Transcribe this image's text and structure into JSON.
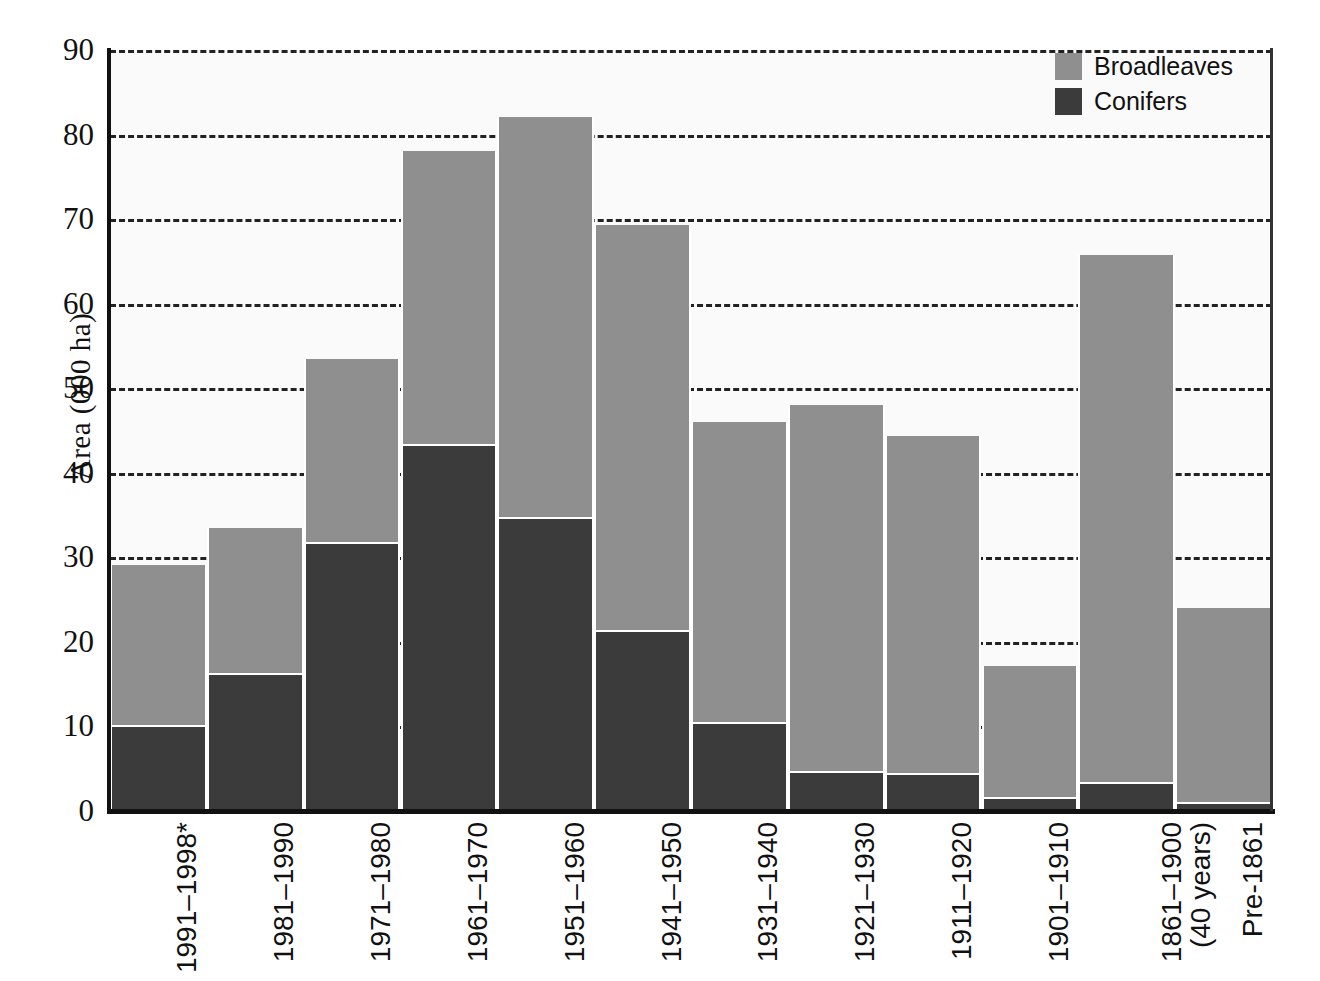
{
  "chart_data": {
    "type": "bar",
    "subtype": "stacked-vertical",
    "title": "",
    "xlabel": "",
    "ylabel": "Area (000 ha)",
    "ylim": [
      0,
      90
    ],
    "ytick_step": 10,
    "yticks": [
      "90",
      "80",
      "70",
      "60",
      "50",
      "40",
      "30",
      "20",
      "10",
      "0"
    ],
    "grid": "horizontal-dashed",
    "legend_position": "top-right",
    "categories": [
      "1991–1998*",
      "1981–1990",
      "1971–1980",
      "1961–1970",
      "1951–1960",
      "1941–1950",
      "1931–1940",
      "1921–1930",
      "1911–1920",
      "1901–1910",
      "1861–1900",
      "Pre-1861"
    ],
    "category_sublabels": [
      "",
      "",
      "",
      "",
      "",
      "",
      "",
      "",
      "",
      "",
      "(40 years)",
      ""
    ],
    "series": [
      {
        "name": "Conifers",
        "color": "#3b3b3b",
        "values": [
          10.0,
          16.2,
          31.7,
          43.3,
          34.6,
          21.2,
          10.4,
          4.5,
          4.3,
          1.5,
          3.2,
          0.8
        ]
      },
      {
        "name": "Broadleaves",
        "color": "#8f8f8f",
        "values": [
          19.1,
          17.3,
          21.8,
          34.7,
          47.5,
          48.1,
          35.6,
          43.5,
          40.1,
          15.7,
          62.6,
          23.2
        ]
      }
    ],
    "totals": [
      29.1,
      33.5,
      53.5,
      78.0,
      82.1,
      69.3,
      46.0,
      48.0,
      44.4,
      17.2,
      65.8,
      24.0
    ]
  },
  "legend": {
    "items": [
      {
        "label": "Broadleaves",
        "color": "#8f8f8f"
      },
      {
        "label": "Conifers",
        "color": "#3b3b3b"
      }
    ]
  },
  "colors": {
    "broadleaves": "#8f8f8f",
    "conifers": "#3b3b3b",
    "axis": "#111111",
    "grid": "#222222",
    "plot_background": "#fafafa"
  }
}
